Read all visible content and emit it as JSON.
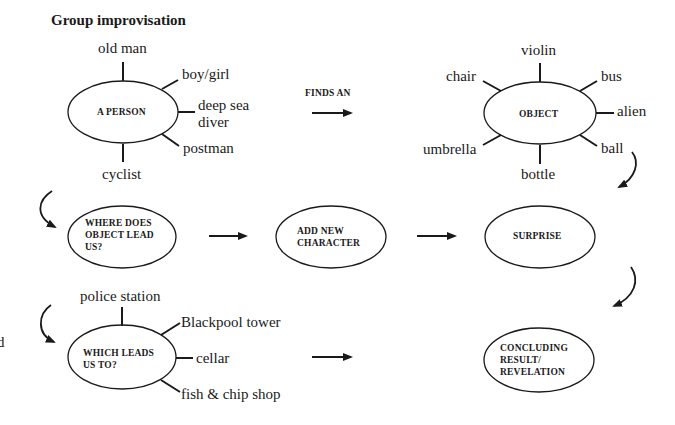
{
  "title": "Group improvisation",
  "fragment_left": "d",
  "nodes": {
    "person": {
      "label": "A PERSON",
      "spokes": {
        "top": "old man",
        "top_right": "boy/girl",
        "right_line1": "deep sea",
        "right_line2": "diver",
        "bottom_right": "postman",
        "bottom": "cyclist"
      }
    },
    "finds_an": "FINDS AN",
    "object": {
      "label": "OBJECT",
      "spokes": {
        "top": "violin",
        "top_left": "chair",
        "top_right": "bus",
        "right": "alien",
        "bottom_right": "ball",
        "bottom": "bottle",
        "bottom_left": "umbrella"
      }
    },
    "where_does": {
      "line1": "WHERE DOES",
      "line2": "OBJECT LEAD",
      "line3": "US?"
    },
    "add_new": {
      "line1": "ADD NEW",
      "line2": "CHARACTER"
    },
    "surprise": {
      "label": "SURPRISE"
    },
    "which_leads": {
      "line1": "WHICH LEADS",
      "line2": "US TO?",
      "spokes": {
        "top": "police station",
        "top_right": "Blackpool tower",
        "right": "cellar",
        "bottom_right": "fish & chip shop"
      }
    },
    "concluding": {
      "line1": "CONCLUDING",
      "line2": "RESULT/",
      "line3": "REVELATION"
    }
  },
  "colors": {
    "stroke": "#1a1a1a",
    "background": "#ffffff"
  }
}
